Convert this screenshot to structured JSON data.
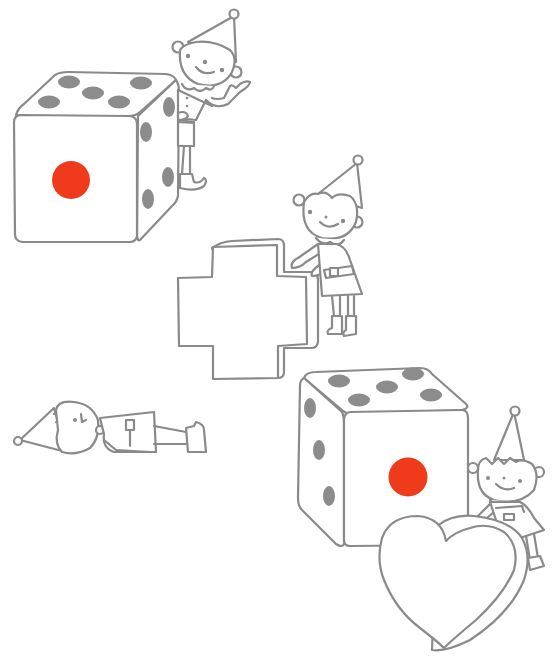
{
  "scene": {
    "title": "Elves playing with dice, a cross and a heart",
    "colors": {
      "background": "#ffffff",
      "line": "#8a8a8a",
      "pip": "#8c8c8c",
      "red_pip": "#f03a1c"
    },
    "objects": [
      {
        "name": "die-top-left",
        "front_face_pips": 1,
        "top_face_pips": 5,
        "side_face_pips": 4
      },
      {
        "name": "elf-peeking",
        "pose": "peeking behind die, waving"
      },
      {
        "name": "cross-block",
        "shape": "plus sign"
      },
      {
        "name": "elf-pushing",
        "pose": "pushing cross"
      },
      {
        "name": "elf-lying",
        "pose": "lying down"
      },
      {
        "name": "die-bottom-right",
        "front_face_pips": 1,
        "top_face_pips": 5,
        "side_face_pips": 3
      },
      {
        "name": "heart-block",
        "shape": "heart"
      },
      {
        "name": "elf-sitting",
        "pose": "sitting on heart"
      }
    ]
  }
}
